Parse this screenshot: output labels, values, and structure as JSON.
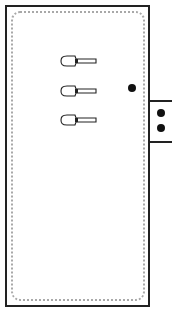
{
  "diagram": {
    "type": "panel-schematic",
    "panel": {
      "outline_color": "#222222",
      "inner_border_color": "#a8a8a8",
      "inner_border_style": "dotted-rounded"
    },
    "switches": [
      {
        "id": 1,
        "icon": "toggle-switch-icon",
        "y": 61
      },
      {
        "id": 2,
        "icon": "toggle-switch-icon",
        "y": 91
      },
      {
        "id": 3,
        "icon": "toggle-switch-icon",
        "y": 120
      }
    ],
    "indicator_dot": {
      "icon": "indicator-dot-icon",
      "color": "#111111"
    },
    "side_connector": {
      "dots": 2,
      "color": "#111111"
    }
  }
}
